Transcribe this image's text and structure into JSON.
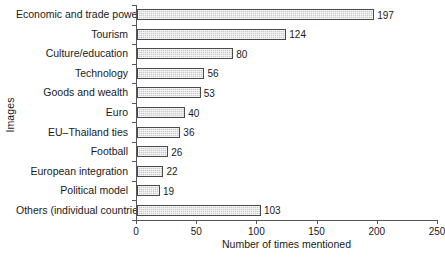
{
  "chart_data": {
    "type": "bar",
    "orientation": "horizontal",
    "title": "",
    "xlabel": "Number of times mentioned",
    "ylabel": "Images",
    "xlim": [
      0,
      250
    ],
    "xticks": [
      0,
      50,
      100,
      150,
      200,
      250
    ],
    "grid": false,
    "legend": false,
    "categories": [
      "Economic and trade power",
      "Tourism",
      "Culture/education",
      "Technology",
      "Goods and wealth",
      "Euro",
      "EU–Thailand ties",
      "Football",
      "European integration",
      "Political model",
      "Others (individual countries)"
    ],
    "values": [
      197,
      124,
      80,
      56,
      53,
      40,
      36,
      26,
      22,
      19,
      103
    ],
    "bar_fill_color": "#c9c9c9",
    "bar_edge_color": "#4a4a4a",
    "axis_color": "#555555",
    "background_color": "#ffffff"
  }
}
